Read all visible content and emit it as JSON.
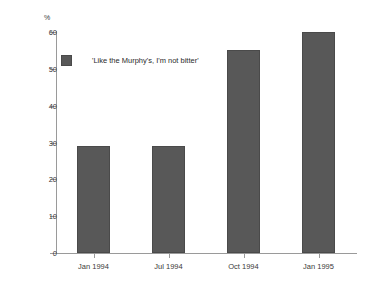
{
  "chart_data": {
    "type": "bar",
    "title": "",
    "subtitle": "",
    "xlabel": "",
    "ylabel": "%",
    "categories": [
      "Jan 1994",
      "Jul 1994",
      "Oct 1994",
      "Jan 1995"
    ],
    "values": [
      29,
      29,
      55,
      60
    ],
    "series": [
      {
        "name": "'Like the Murphy's, I'm not bitter'",
        "values": [
          29,
          29,
          55,
          60
        ]
      }
    ],
    "ylim": [
      0,
      60
    ],
    "ytick_step": 10,
    "ytick_labels": [
      "0",
      "10",
      "20",
      "30",
      "40",
      "50",
      "60"
    ],
    "grid": false,
    "legend": {
      "position": "inside-top-left",
      "entries": [
        {
          "label": "'Like the Murphy's, I'm not bitter'",
          "color": "#585858"
        }
      ]
    },
    "colors": {
      "bar_fill": "#585858",
      "bar_edge": "#4a4a4a",
      "axis": "#9a9a9a",
      "text": "#2b2b2b",
      "background": "#ffffff"
    }
  }
}
